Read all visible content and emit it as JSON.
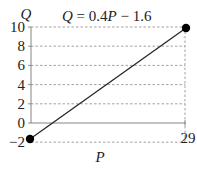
{
  "chart_data": {
    "type": "line",
    "title": "Q = 0.4P − 1.6",
    "equation": {
      "lhs": "Q",
      "eq": " = 0.4",
      "var": "P",
      "rest": " − 1.6"
    },
    "xlabel": "P",
    "ylabel": "Q",
    "xlim": [
      -1,
      29
    ],
    "ylim": [
      -2,
      10
    ],
    "x_ticks": [
      {
        "value": 29,
        "label": "29"
      }
    ],
    "y_ticks": [
      {
        "value": 10,
        "label": "10"
      },
      {
        "value": 8,
        "label": "8"
      },
      {
        "value": 6,
        "label": "6"
      },
      {
        "value": 4,
        "label": "4"
      },
      {
        "value": 2,
        "label": "2"
      },
      {
        "value": 0,
        "label": "0"
      },
      {
        "value": -2,
        "label": "−2"
      }
    ],
    "grid": "horizontal dashed at y ticks; vertical dashed at x=29",
    "series": [
      {
        "name": "Q = 0.4P - 1.6",
        "x": [
          -1,
          29
        ],
        "y": [
          -2,
          10
        ],
        "endpoints_marked": true,
        "color": "#222222"
      }
    ],
    "colors": {
      "line": "#222222",
      "grid": "#8a8a8a",
      "axis": "#777777"
    }
  }
}
